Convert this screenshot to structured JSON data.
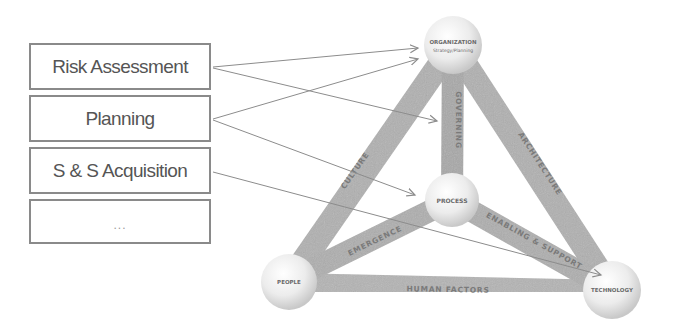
{
  "process_list": {
    "items": [
      {
        "label": "Risk Assessment"
      },
      {
        "label": "Planning"
      },
      {
        "label": "S & S Acquisition"
      },
      {
        "label": "..."
      }
    ]
  },
  "framework": {
    "nodes": {
      "organization": {
        "label": "ORGANIZATION",
        "sublabel": "Strategy/Planning"
      },
      "process": {
        "label": "PROCESS"
      },
      "people": {
        "label": "PEOPLE"
      },
      "technology": {
        "label": "TECHNOLOGY"
      }
    },
    "edges": {
      "culture": {
        "label": "CULTURE"
      },
      "governing": {
        "label": "GOVERNING"
      },
      "architecture": {
        "label": "ARCHITECTURE"
      },
      "emergence": {
        "label": "EMERGENCE"
      },
      "enabling_support": {
        "label": "ENABLING & SUPPORT"
      },
      "human_factors": {
        "label": "HUMAN FACTORS"
      }
    }
  },
  "arrows": [
    {
      "from": "Risk Assessment",
      "to": "ORGANIZATION"
    },
    {
      "from": "Risk Assessment",
      "to": "GOVERNING"
    },
    {
      "from": "Planning",
      "to": "ORGANIZATION"
    },
    {
      "from": "Planning",
      "to": "PROCESS"
    },
    {
      "from": "S & S Acquisition",
      "to": "TECHNOLOGY"
    }
  ],
  "colors": {
    "bar": "#b4b4b4",
    "bar_dark": "#9c9c9c",
    "node": "#efefef",
    "arrow": "#8c8c8c",
    "box_border": "#8a8a8a"
  }
}
